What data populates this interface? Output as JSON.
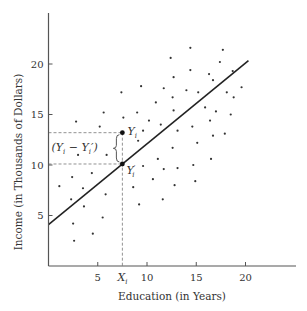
{
  "chart_data": {
    "type": "scatter",
    "title": "",
    "xlabel": "Education (in Years)",
    "ylabel": "Income (in Thousands of Dollars)",
    "xlim": [
      0,
      25
    ],
    "ylim": [
      0,
      25
    ],
    "x_ticks": [
      5,
      10,
      15,
      20
    ],
    "y_ticks": [
      5,
      10,
      15,
      20
    ],
    "x_tick_labels": [
      "5",
      "10",
      "15",
      "20"
    ],
    "y_tick_labels": [
      "5",
      "10",
      "15",
      "20"
    ],
    "grid": false,
    "legend": null,
    "points": [
      [
        1.1,
        7.9
      ],
      [
        2.4,
        8.8
      ],
      [
        4.4,
        9.2
      ],
      [
        3.5,
        7.7
      ],
      [
        2.3,
        6.6
      ],
      [
        5.8,
        7.1
      ],
      [
        3.6,
        5.9
      ],
      [
        5.5,
        4.8
      ],
      [
        2.5,
        4.2
      ],
      [
        4.5,
        3.2
      ],
      [
        2.6,
        2.5
      ],
      [
        3.0,
        11.0
      ],
      [
        5.9,
        11.0
      ],
      [
        2.8,
        14.3
      ],
      [
        5.6,
        15.2
      ],
      [
        5.2,
        13.8
      ],
      [
        7.4,
        17.2
      ],
      [
        7.6,
        14.7
      ],
      [
        9.0,
        15.2
      ],
      [
        9.6,
        13.4
      ],
      [
        9.4,
        17.8
      ],
      [
        9.1,
        12.4
      ],
      [
        14.4,
        21.6
      ],
      [
        17.7,
        21.4
      ],
      [
        12.4,
        20.6
      ],
      [
        17.4,
        20.2
      ],
      [
        14.4,
        19.4
      ],
      [
        12.7,
        18.7
      ],
      [
        16.3,
        19.0
      ],
      [
        18.7,
        19.3
      ],
      [
        16.7,
        18.4
      ],
      [
        11.7,
        17.6
      ],
      [
        14.0,
        17.4
      ],
      [
        15.2,
        17.2
      ],
      [
        19.6,
        17.7
      ],
      [
        18.1,
        17.2
      ],
      [
        12.6,
        16.7
      ],
      [
        18.8,
        16.7
      ],
      [
        10.9,
        16.2
      ],
      [
        15.9,
        15.7
      ],
      [
        12.7,
        15.4
      ],
      [
        17.0,
        15.3
      ],
      [
        18.5,
        15.0
      ],
      [
        10.2,
        14.4
      ],
      [
        11.4,
        14.0
      ],
      [
        16.4,
        14.4
      ],
      [
        13.1,
        13.4
      ],
      [
        14.6,
        13.8
      ],
      [
        16.7,
        12.9
      ],
      [
        17.9,
        13.1
      ],
      [
        15.1,
        12.2
      ],
      [
        12.6,
        11.7
      ],
      [
        16.5,
        10.6
      ],
      [
        11.1,
        10.6
      ],
      [
        9.6,
        9.9
      ],
      [
        14.7,
        10.0
      ],
      [
        11.7,
        9.6
      ],
      [
        13.1,
        9.7
      ],
      [
        10.6,
        8.6
      ],
      [
        14.9,
        8.4
      ],
      [
        12.8,
        8.0
      ],
      [
        8.6,
        7.8
      ],
      [
        11.6,
        6.6
      ],
      [
        9.2,
        6.1
      ]
    ],
    "regression_line": {
      "intercept": 4.1,
      "slope": 0.8,
      "x_range": [
        0,
        20.3
      ]
    },
    "highlight": {
      "x": 7.5,
      "observed_y": 13.2,
      "predicted_y": 10.1,
      "x_label": "X",
      "x_label_sub": "i",
      "observed_label": "Y",
      "observed_label_sub": "i",
      "predicted_label": "Y",
      "predicted_label_sub": "i",
      "predicted_prime": "′",
      "residual_label_open": "(Y",
      "residual_label_sub1": "i",
      "residual_label_mid": " − Y",
      "residual_label_sub2": "i",
      "residual_label_close": "′)"
    }
  }
}
